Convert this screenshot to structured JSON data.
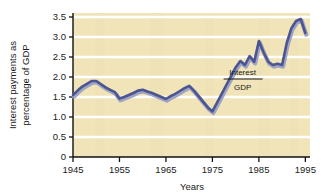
{
  "chart_data": {
    "type": "line",
    "title": "",
    "subtitle": "",
    "xlabel": "Years",
    "ylabel": "Interest payments as percentage of GDP",
    "xlim": [
      1945,
      1996
    ],
    "ylim": [
      0,
      3.6
    ],
    "xticks": [
      1945,
      1955,
      1965,
      1975,
      1985,
      1995
    ],
    "xtick_labels": [
      "1945",
      "1955",
      "1965",
      "1975",
      "1985",
      "1995"
    ],
    "yticks": [
      0,
      0.5,
      1.0,
      1.5,
      2.0,
      2.5,
      3.0,
      3.5
    ],
    "ytick_labels": [
      "0",
      "0.5",
      "1.0",
      "1.5",
      "2.0",
      "2.5",
      "3.0",
      "3.5"
    ],
    "grid": "horizontal-white-lines",
    "legend": "none",
    "plot_background": "#f0e4b8",
    "line_color": "#4c5590",
    "line_highlight": "#9aa0c4",
    "annotations": [
      {
        "name": "interest-over-gdp-ratio",
        "numerator": "Interest",
        "denominator": "GDP",
        "x": 1981.5,
        "y": 1.95
      }
    ],
    "series": [
      {
        "name": "Interest payments as percentage of GDP",
        "color": "#4c5590",
        "x": [
          1945,
          1946,
          1947,
          1948,
          1949,
          1950,
          1951,
          1952,
          1953,
          1954,
          1955,
          1956,
          1957,
          1958,
          1959,
          1960,
          1961,
          1962,
          1963,
          1964,
          1965,
          1966,
          1967,
          1968,
          1969,
          1970,
          1971,
          1972,
          1973,
          1974,
          1975,
          1976,
          1977,
          1978,
          1979,
          1980,
          1981,
          1982,
          1983,
          1984,
          1985,
          1986,
          1987,
          1988,
          1989,
          1990,
          1991,
          1992,
          1993,
          1994,
          1995
        ],
        "values": [
          1.55,
          1.66,
          1.76,
          1.83,
          1.9,
          1.9,
          1.82,
          1.74,
          1.68,
          1.62,
          1.46,
          1.5,
          1.55,
          1.6,
          1.66,
          1.68,
          1.64,
          1.6,
          1.55,
          1.5,
          1.45,
          1.52,
          1.58,
          1.65,
          1.72,
          1.78,
          1.66,
          1.52,
          1.38,
          1.24,
          1.14,
          1.36,
          1.58,
          1.8,
          2.02,
          2.24,
          2.4,
          2.3,
          2.52,
          2.38,
          2.9,
          2.62,
          2.38,
          2.3,
          2.33,
          2.3,
          2.85,
          3.22,
          3.4,
          3.45,
          3.1
        ]
      }
    ]
  },
  "axes": {
    "ylabel_line1": "Interest payments as",
    "ylabel_line2": "percentage of GDP"
  }
}
